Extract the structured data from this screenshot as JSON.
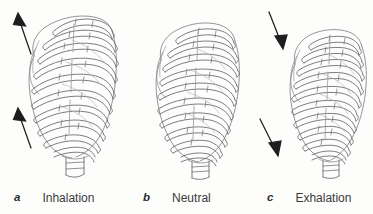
{
  "figure": {
    "background_color": "#fdfdfc",
    "line_color": "#6e6e72",
    "arrow_color": "#1d1d1d",
    "text_color": "#3a3a3a",
    "panels": [
      {
        "letter": "a",
        "label": "Inhalation",
        "arrows": "two arrows pointing up and to the left",
        "arrow_direction": "up-left"
      },
      {
        "letter": "b",
        "label": "Neutral",
        "arrows": "none",
        "arrow_direction": "none"
      },
      {
        "letter": "c",
        "label": "Exhalation",
        "arrows": "two arrows pointing down and to the right",
        "arrow_direction": "down-right"
      }
    ]
  }
}
